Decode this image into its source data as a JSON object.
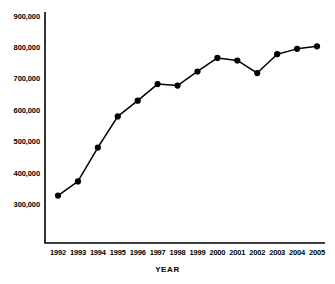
{
  "chart_data": {
    "type": "line",
    "title": "",
    "subtitle": "",
    "xlabel": "YEAR",
    "ylabel": "",
    "categories": [
      "1992",
      "1993",
      "1994",
      "1995",
      "1996",
      "1997",
      "1998",
      "1999",
      "2000",
      "2001",
      "2002",
      "2003",
      "2004",
      "2005"
    ],
    "values": [
      330000,
      375000,
      483000,
      582000,
      632000,
      685000,
      680000,
      725000,
      768000,
      760000,
      720000,
      780000,
      797000,
      805000
    ],
    "series": [
      {
        "name": "",
        "values": [
          330000,
          375000,
          483000,
          582000,
          632000,
          685000,
          680000,
          725000,
          768000,
          760000,
          720000,
          780000,
          797000,
          805000
        ]
      }
    ],
    "ylim": [
      200000,
      900000
    ],
    "yticks": [
      300000,
      400000,
      500000,
      600000,
      700000,
      800000,
      900000
    ],
    "ytick_labels": [
      "300,000",
      "400,000",
      "500,000",
      "600,000",
      "700,000",
      "800,000",
      "900,000"
    ],
    "xtick_labels": [
      "1992",
      "1993",
      "1994",
      "1995",
      "1996",
      "1997",
      "1998",
      "1999",
      "2000",
      "2001",
      "2002",
      "2003",
      "2004",
      "2005"
    ],
    "grid": false,
    "legend": null,
    "legend_position": "none",
    "marker": "filled-circle",
    "line_color": "#000000",
    "marker_color": "#000000",
    "axis_color": "#000000",
    "background_color": "#ffffff",
    "annotations": []
  },
  "axes": {
    "x_axis_title": "YEAR"
  }
}
